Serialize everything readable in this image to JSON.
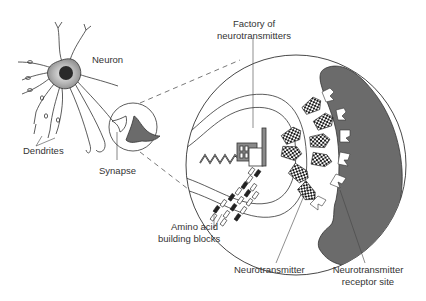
{
  "diagram": {
    "type": "labeled-illustration",
    "colors": {
      "stroke": "#333333",
      "cell_fill": "#6b6b6b",
      "soma_gradient_light": "#d8d8d8",
      "soma_gradient_dark": "#8a8a8a",
      "nucleus": "#2a2a2a",
      "background": "#ffffff"
    },
    "labels": {
      "neuron": "Neuron",
      "dendrites": "Dendrites",
      "synapse": "Synapse",
      "factory_line1": "Factory of",
      "factory_line2": "neurotransmitters",
      "amino_line1": "Amino acid",
      "amino_line2": "building blocks",
      "neurotransmitter": "Neurotransmitter",
      "receptor_line1": "Neurotransmitter",
      "receptor_line2": "receptor site"
    },
    "parts": [
      {
        "id": "neuron",
        "label": "Neuron"
      },
      {
        "id": "dendrites",
        "label": "Dendrites"
      },
      {
        "id": "synapse",
        "label": "Synapse"
      },
      {
        "id": "factory",
        "label": "Factory of neurotransmitters"
      },
      {
        "id": "amino-acids",
        "label": "Amino acid building blocks"
      },
      {
        "id": "neurotransmitter",
        "label": "Neurotransmitter"
      },
      {
        "id": "receptor-site",
        "label": "Neurotransmitter receptor site"
      }
    ]
  }
}
